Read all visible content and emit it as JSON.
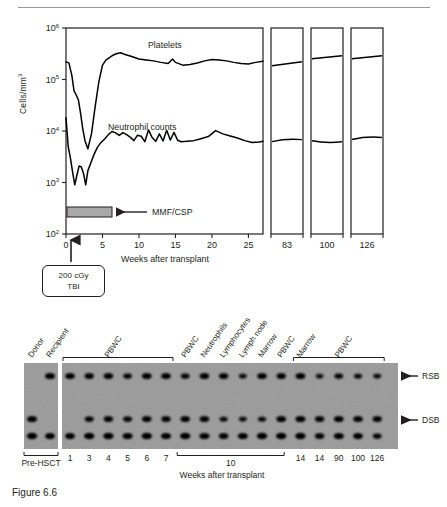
{
  "figure": {
    "caption": "Figure 6.6"
  },
  "chart_data": {
    "type": "line",
    "title": "",
    "xlabel": "Weeks after transplant",
    "ylabel": "Cells/mm",
    "ylabel_sup": "3",
    "yscale": "log",
    "ylim": [
      100,
      1000000
    ],
    "ytick_labels": [
      "10",
      "10",
      "10",
      "10",
      "10"
    ],
    "ytick_exponents": [
      "6",
      "5",
      "4",
      "3",
      "2"
    ],
    "ytick_values": [
      1000000,
      100000,
      10000,
      1000,
      100
    ],
    "xlim": [
      0,
      27
    ],
    "xtick_labels": [
      "0",
      "5",
      "10",
      "15",
      "20",
      "25"
    ],
    "xtick_values": [
      0,
      5,
      10,
      15,
      20,
      25
    ],
    "break_panels": [
      {
        "label": "83",
        "value": 83
      },
      {
        "label": "100",
        "value": 100
      },
      {
        "label": "126",
        "value": 126
      }
    ],
    "grid": false,
    "legend": "inline-annotation",
    "series": [
      {
        "name": "Platelets",
        "annotation": "Platelets",
        "x": [
          0,
          0.4,
          0.8,
          1.1,
          1.4,
          1.7,
          2.0,
          2.3,
          2.6,
          3.0,
          3.5,
          4.0,
          4.5,
          5.0,
          5.5,
          6.0,
          6.5,
          7.0,
          7.5,
          8.0,
          9.0,
          10.0,
          11.0,
          12.0,
          13.0,
          14.0,
          14.6,
          15.0,
          16.0,
          17.0,
          18.0,
          19.0,
          20.0,
          21.0,
          22.0,
          23.0,
          24.0,
          25.0,
          26.0,
          27.0
        ],
        "y": [
          220000,
          210000,
          120000,
          60000,
          50000,
          40000,
          22000,
          11000,
          6500,
          4500,
          9000,
          30000,
          90000,
          190000,
          240000,
          270000,
          300000,
          320000,
          330000,
          310000,
          280000,
          250000,
          240000,
          230000,
          215000,
          205000,
          250000,
          215000,
          190000,
          195000,
          210000,
          230000,
          245000,
          240000,
          230000,
          215000,
          205000,
          200000,
          215000,
          225000
        ]
      },
      {
        "name": "Neutrophil counts",
        "annotation": "Neutrophil counts",
        "x": [
          0,
          0.3,
          0.6,
          0.9,
          1.2,
          1.5,
          1.8,
          2.1,
          2.4,
          2.7,
          3.0,
          3.4,
          3.8,
          4.3,
          4.8,
          5.3,
          5.8,
          6.3,
          6.8,
          7.3,
          7.8,
          8.3,
          8.8,
          9.3,
          9.8,
          10.3,
          10.8,
          11.3,
          11.8,
          12.3,
          12.8,
          13.3,
          13.8,
          14.3,
          14.8,
          15.3,
          15.8,
          16.5,
          17.5,
          18.5,
          19.5,
          20.5,
          21.5,
          22.5,
          23.5,
          24.5,
          25.5,
          26.5,
          27.0
        ],
        "y": [
          18000,
          5000,
          3000,
          1600,
          900,
          1400,
          2100,
          2000,
          1500,
          900,
          1700,
          2400,
          3400,
          4800,
          6000,
          7000,
          8500,
          9800,
          9200,
          8200,
          9300,
          8500,
          7600,
          6500,
          8300,
          7900,
          6200,
          10500,
          7500,
          6300,
          8800,
          6400,
          10300,
          6700,
          9400,
          6600,
          6200,
          6300,
          6500,
          7100,
          7800,
          10200,
          8800,
          8000,
          7300,
          6500,
          6000,
          6100,
          6300
        ]
      }
    ],
    "panel_values": {
      "83": {
        "platelets": 220000,
        "neutrophils": 6800
      },
      "100": {
        "platelets": 290000,
        "neutrophils": 6200
      },
      "126": {
        "platelets": 290000,
        "neutrophils": 7500
      }
    },
    "annotations": [
      {
        "name": "mmf-csp",
        "label": "MMF/CSP",
        "bar_start_week": 0,
        "bar_end_week": 5,
        "bar_level": 250,
        "color": "#a8a8a8"
      },
      {
        "name": "tbi",
        "line1": "200 cGy",
        "line2": "TBI",
        "week": 0
      }
    ]
  },
  "gel": {
    "xlabel": "Weeks after transplant",
    "band_labels": [
      {
        "name": "rsb",
        "text": "RSB"
      },
      {
        "name": "dsb",
        "text": "DSB"
      }
    ],
    "brackets": [
      {
        "name": "pbwc-early",
        "label": "PBWC",
        "from_lane": 2,
        "to_lane": 7
      },
      {
        "name": "pbwc-late",
        "label": "PBWC",
        "from_lane": 14,
        "to_lane": 18
      },
      {
        "name": "pre-hsct",
        "label": "Pre-HSCT",
        "from_lane": 0,
        "to_lane": 1
      },
      {
        "name": "week-10",
        "label": "10",
        "from_lane": 8,
        "to_lane": 12
      }
    ],
    "column_headers": [
      "Donor",
      "Recipient",
      "PBWC",
      "PBWC",
      "PBWC",
      "PBWC",
      "PBWC",
      "PBWC",
      "PBWC",
      "Neutrophils",
      "Lymphocytes",
      "Lymph node",
      "Marrow",
      "PBWC",
      "Marrow",
      "PBWC",
      "PBWC",
      "PBWC",
      "PBWC"
    ],
    "visible_headers": [
      {
        "lane": 0,
        "text": "Donor"
      },
      {
        "lane": 1,
        "text": "Recipient"
      },
      {
        "lane": 4,
        "text": "PBWC"
      },
      {
        "lane": 8,
        "text": "PBWC"
      },
      {
        "lane": 9,
        "text": "Neutrophils"
      },
      {
        "lane": 10,
        "text": "Lymphocytes"
      },
      {
        "lane": 11,
        "text": "Lymph node"
      },
      {
        "lane": 12,
        "text": "Marrow"
      },
      {
        "lane": 13,
        "text": "PBWC"
      },
      {
        "lane": 14,
        "text": "Marrow"
      },
      {
        "lane": 16,
        "text": "PBWC"
      }
    ],
    "lane_numbers": [
      {
        "lane": 2,
        "text": "1"
      },
      {
        "lane": 3,
        "text": "3"
      },
      {
        "lane": 4,
        "text": "4"
      },
      {
        "lane": 5,
        "text": "5"
      },
      {
        "lane": 6,
        "text": "6"
      },
      {
        "lane": 7,
        "text": "7"
      },
      {
        "lane": 14,
        "text": "14"
      },
      {
        "lane": 15,
        "text": "14"
      },
      {
        "lane": 16,
        "text": "90"
      },
      {
        "lane": 17,
        "text": "100"
      },
      {
        "lane": 18,
        "text": "126"
      }
    ],
    "bands": [
      {
        "lane": 0,
        "rsb": 0,
        "dsb": 0.95,
        "low": 1.0
      },
      {
        "lane": 1,
        "rsb": 0.95,
        "dsb": 0,
        "low": 0.9
      },
      {
        "lane": 2,
        "rsb": 0.85,
        "dsb": 0,
        "low": 0.9
      },
      {
        "lane": 3,
        "rsb": 0.8,
        "dsb": 0.75,
        "low": 1.0
      },
      {
        "lane": 4,
        "rsb": 0.85,
        "dsb": 0.8,
        "low": 1.0
      },
      {
        "lane": 5,
        "rsb": 0.7,
        "dsb": 0.75,
        "low": 0.95
      },
      {
        "lane": 6,
        "rsb": 0.9,
        "dsb": 0.85,
        "low": 1.0
      },
      {
        "lane": 7,
        "rsb": 0.85,
        "dsb": 0.8,
        "low": 0.95
      },
      {
        "lane": 8,
        "rsb": 0.7,
        "dsb": 0.85,
        "low": 1.0
      },
      {
        "lane": 9,
        "rsb": 0.85,
        "dsb": 0.85,
        "low": 0.95
      },
      {
        "lane": 10,
        "rsb": 0.8,
        "dsb": 0.6,
        "low": 0.85
      },
      {
        "lane": 11,
        "rsb": 0.55,
        "dsb": 0.55,
        "low": 0.95
      },
      {
        "lane": 12,
        "rsb": 0.85,
        "dsb": 0.6,
        "low": 1.0
      },
      {
        "lane": 13,
        "rsb": 0.8,
        "dsb": 0.9,
        "low": 1.0
      },
      {
        "lane": 14,
        "rsb": 0.9,
        "dsb": 0.95,
        "low": 1.0
      },
      {
        "lane": 15,
        "rsb": 0.5,
        "dsb": 0.8,
        "low": 0.8
      },
      {
        "lane": 16,
        "rsb": 0.7,
        "dsb": 0.9,
        "low": 0.95
      },
      {
        "lane": 17,
        "rsb": 0.6,
        "dsb": 0.85,
        "low": 0.9
      },
      {
        "lane": 18,
        "rsb": 0.55,
        "dsb": 0.8,
        "low": 0.7
      }
    ]
  }
}
